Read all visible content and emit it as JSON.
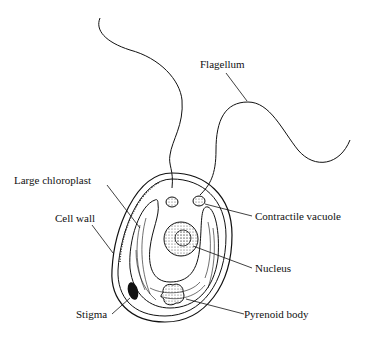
{
  "diagram": {
    "labels": {
      "flagellum": "Flagellum",
      "large_chloroplast": "Large chloroplast",
      "cell_wall": "Cell wall",
      "contractile_vacuole": "Contractile vacuole",
      "nucleus": "Nucleus",
      "stigma": "Stigma",
      "pyrenoid_body": "Pyrenoid body"
    },
    "colors": {
      "ink": "#111111",
      "background": "#ffffff"
    }
  }
}
